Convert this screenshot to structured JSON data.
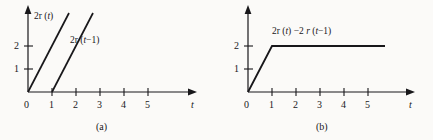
{
  "figure": {
    "background_color": "#fbfaf8",
    "ink_color": "#18171a",
    "panels": [
      {
        "caption": "(a)",
        "origin_label": "0",
        "x_axis_label": "t",
        "x_tick_labels": [
          "1",
          "2",
          "3",
          "4",
          "5"
        ],
        "y_tick_labels": [
          "1",
          "2"
        ],
        "curve_labels": [
          "2r (t)",
          "2r (t−1)"
        ]
      },
      {
        "caption": "(b)",
        "origin_label": "0",
        "x_axis_label": "t",
        "x_tick_labels": [
          "1",
          "2",
          "3",
          "4",
          "5"
        ],
        "y_tick_labels": [
          "1",
          "2"
        ],
        "curve_labels": [
          "2r (t) −2 r (t−1)"
        ]
      }
    ]
  },
  "chart_data": [
    {
      "type": "line",
      "title": "",
      "panel": "(a)",
      "xlabel": "t",
      "ylabel": "",
      "xlim": [
        0,
        6.6
      ],
      "ylim": [
        0,
        3.6
      ],
      "xticks": [
        1,
        2,
        3,
        4,
        5
      ],
      "yticks": [
        1,
        2
      ],
      "grid": false,
      "legend": "inline-annotation",
      "series": [
        {
          "name": "2r (t)",
          "comment": "ramp starting at t=0 with slope 2, clipped at top of plot box",
          "x": [
            0,
            1.72
          ],
          "y": [
            0,
            3.44
          ]
        },
        {
          "name": "2r (t−1)",
          "comment": "ramp starting at t=1 with slope 2, clipped at top of plot box",
          "x": [
            1,
            2.72
          ],
          "y": [
            0,
            3.44
          ]
        }
      ]
    },
    {
      "type": "line",
      "title": "",
      "panel": "(b)",
      "xlabel": "t",
      "ylabel": "",
      "xlim": [
        0,
        6.6
      ],
      "ylim": [
        0,
        3.6
      ],
      "xticks": [
        1,
        2,
        3,
        4,
        5
      ],
      "yticks": [
        1,
        2
      ],
      "grid": false,
      "legend": "inline-annotation",
      "series": [
        {
          "name": "2r (t) −2 r (t−1)",
          "comment": "ramp 0 to 2 over t in [0,1] then constant 2",
          "x": [
            0,
            1,
            5.7
          ],
          "y": [
            0,
            2,
            2
          ]
        }
      ]
    }
  ]
}
